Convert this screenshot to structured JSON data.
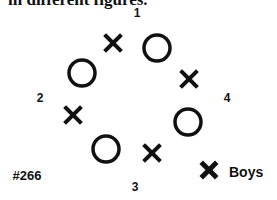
{
  "caption": "in different figures.",
  "figure_number": "#266",
  "position_labels": [
    {
      "text": "1",
      "x": 137,
      "y": 13
    },
    {
      "text": "2",
      "x": 40,
      "y": 98
    },
    {
      "text": "4",
      "x": 227,
      "y": 98
    },
    {
      "text": "3",
      "x": 135,
      "y": 187
    }
  ],
  "players": [
    {
      "type": "x",
      "x": 113,
      "y": 43
    },
    {
      "type": "o",
      "x": 157,
      "y": 48
    },
    {
      "type": "o",
      "x": 82,
      "y": 73
    },
    {
      "type": "x",
      "x": 189,
      "y": 79
    },
    {
      "type": "x",
      "x": 73,
      "y": 115
    },
    {
      "type": "o",
      "x": 188,
      "y": 122
    },
    {
      "type": "o",
      "x": 106,
      "y": 149
    },
    {
      "type": "x",
      "x": 152,
      "y": 153
    }
  ],
  "legend": {
    "symbol": "x",
    "label": "Boys"
  },
  "colors": {
    "ink": "#111111",
    "background": "#ffffff"
  }
}
